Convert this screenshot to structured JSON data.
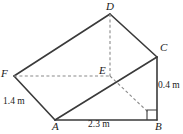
{
  "figure": {
    "stroke_color": "#3a3a3a",
    "dash_color": "#8a8a8a",
    "vertices": [
      {
        "id": "A",
        "label": "A",
        "x": 55,
        "y": 120
      },
      {
        "id": "B",
        "label": "B",
        "x": 157,
        "y": 120
      },
      {
        "id": "C",
        "label": "C",
        "x": 157,
        "y": 57
      },
      {
        "id": "D",
        "label": "D",
        "x": 110,
        "y": 14
      },
      {
        "id": "E",
        "label": "E",
        "x": 110,
        "y": 76
      },
      {
        "id": "F",
        "label": "F",
        "x": 14,
        "y": 76
      }
    ],
    "vertex_labels": [
      {
        "id": "A",
        "text": "A",
        "left": 52,
        "top": 121
      },
      {
        "id": "B",
        "text": "B",
        "left": 155,
        "top": 121
      },
      {
        "id": "C",
        "text": "C",
        "left": 160,
        "top": 42
      },
      {
        "id": "D",
        "text": "D",
        "left": 106,
        "top": 1
      },
      {
        "id": "E",
        "text": "E",
        "left": 99,
        "top": 65
      },
      {
        "id": "F",
        "text": "F",
        "left": 1,
        "top": 68
      }
    ],
    "solid_edges": [
      {
        "name": "edge-A-B",
        "from": "A",
        "to": "B"
      },
      {
        "name": "edge-B-C",
        "from": "B",
        "to": "C"
      },
      {
        "name": "edge-A-C",
        "from": "A",
        "to": "C"
      },
      {
        "name": "edge-C-D",
        "from": "C",
        "to": "D"
      },
      {
        "name": "edge-D-F",
        "from": "D",
        "to": "F"
      },
      {
        "name": "edge-F-A",
        "from": "F",
        "to": "A"
      }
    ],
    "dashed_edges": [
      {
        "name": "edge-D-E",
        "from": "D",
        "to": "E"
      },
      {
        "name": "edge-F-E",
        "from": "F",
        "to": "E"
      },
      {
        "name": "edge-E-foot",
        "from": "E",
        "to": "foot"
      }
    ],
    "foot_point": {
      "x": 148,
      "y": 112
    },
    "right_angle_marker": {
      "name": "right-angle-marker",
      "corner_x": 157,
      "corner_y": 120,
      "size": 10
    },
    "measurements": [
      {
        "name": "measure-height-BC",
        "text": "0.4 m",
        "left": 158,
        "top": 80
      },
      {
        "name": "measure-edge-FA",
        "text": "1.4 m",
        "left": 3,
        "top": 96
      },
      {
        "name": "measure-edge-AB",
        "text": "2.3 m",
        "left": 88,
        "top": 119
      }
    ]
  }
}
